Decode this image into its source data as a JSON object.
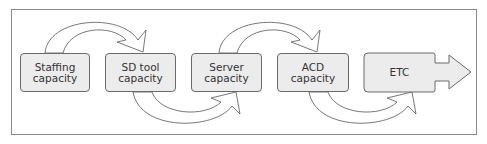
{
  "diagram": {
    "type": "capacity-flow",
    "nodes": [
      {
        "id": "staffing",
        "line1": "Staffing",
        "line2": "capacity"
      },
      {
        "id": "sd-tool",
        "line1": "SD tool",
        "line2": "capacity"
      },
      {
        "id": "server",
        "line1": "Server",
        "line2": "capacity"
      },
      {
        "id": "acd",
        "line1": "ACD",
        "line2": "capacity"
      },
      {
        "id": "etc",
        "line1": "ETC",
        "line2": ""
      }
    ],
    "edges": [
      {
        "from": "staffing",
        "to": "sd-tool",
        "style": "curved-arrow-over"
      },
      {
        "from": "sd-tool",
        "to": "server",
        "style": "curved-arrow-under"
      },
      {
        "from": "server",
        "to": "acd",
        "style": "curved-arrow-over"
      },
      {
        "from": "acd",
        "to": "etc",
        "style": "curved-arrow-under"
      },
      {
        "from": "etc",
        "to": "",
        "style": "block-arrow-right"
      }
    ],
    "colors": {
      "box_fill": "#ececec",
      "box_stroke": "#6a6a6a",
      "frame_stroke": "#8a8a8a"
    }
  }
}
